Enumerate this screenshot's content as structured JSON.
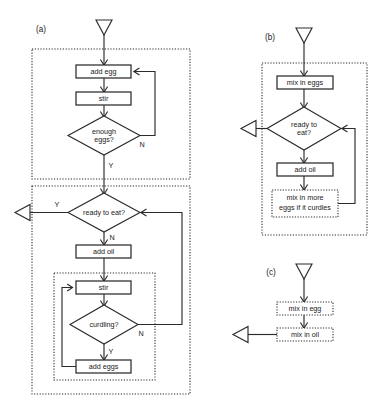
{
  "figure": {
    "kind": "flowchart-diagram",
    "background_color": "#ffffff",
    "line_color": "#2b2b2b",
    "panels": [
      {
        "id": "a",
        "label": "(a)",
        "nodes": {
          "add_egg": "add egg",
          "stir_top": "stir",
          "enough_eggs": "enough eggs?",
          "enough_eggs_line1": "enough",
          "enough_eggs_line2": "eggs?",
          "ready_to_eat": "ready to eat?",
          "add_oil": "add oil",
          "stir_bottom": "stir",
          "curdling": "curdling?",
          "add_eggs": "add eggs"
        },
        "branch_labels": {
          "enough_eggs_no": "N",
          "enough_eggs_yes": "Y",
          "ready_to_eat_yes": "Y",
          "ready_to_eat_no": "N",
          "curdling_no": "N",
          "curdling_yes": "Y"
        }
      },
      {
        "id": "b",
        "label": "(b)",
        "nodes": {
          "mix_in_eggs": "mix in eggs",
          "ready_to_eat": "ready to eat?",
          "ready_to_eat_line1": "ready to",
          "ready_to_eat_line2": "eat?",
          "add_oil": "add oil",
          "mix_in_more": "mix in more eggs if it curdles",
          "mix_in_more_line1": "mix in more",
          "mix_in_more_line2": "eggs if it curdles"
        }
      },
      {
        "id": "c",
        "label": "(c)",
        "nodes": {
          "mix_in_egg": "mix in egg",
          "mix_in_oil": "mix in oil"
        }
      }
    ]
  }
}
